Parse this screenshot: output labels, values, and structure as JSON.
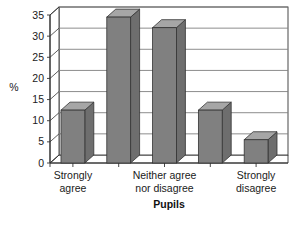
{
  "chart_data": {
    "type": "bar",
    "title": "",
    "subtitle": "",
    "xlabel": "Pupils",
    "ylabel": "%",
    "categories": [
      "Strongly agree",
      "",
      "Neither agree nor disagree",
      "",
      "Strongly disagree"
    ],
    "category_lines": [
      [
        "Strongly",
        "agree"
      ],
      [
        "",
        ""
      ],
      [
        "Neither agree",
        "nor disagree"
      ],
      [
        "",
        ""
      ],
      [
        "Strongly",
        "disagree"
      ]
    ],
    "values": [
      12.5,
      34.5,
      32,
      12.5,
      5.5
    ],
    "ylim": [
      0,
      35
    ],
    "yticks": [
      0,
      5,
      10,
      15,
      20,
      25,
      30,
      35
    ],
    "ytick_labels": [
      "0",
      "5",
      "10",
      "15",
      "20",
      "25",
      "30",
      "35"
    ],
    "grid": true,
    "grid_axis": "y",
    "legend": false,
    "legend_position": "none",
    "style": "3d-column",
    "colors": {
      "bar_front": "#808080",
      "bar_top": "#a6a6a6",
      "bar_side": "#6e6e6e",
      "bar_outline": "#333333",
      "grid": "#808080",
      "axis": "#333333",
      "plot_background": "#ffffff",
      "text": "#1a1a1a"
    }
  }
}
